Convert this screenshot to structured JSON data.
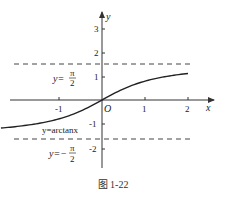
{
  "chart_data": {
    "type": "line",
    "title": "",
    "xlabel": "x",
    "ylabel": "y",
    "origin_label": "O",
    "xlim": [
      -2.4,
      2.3
    ],
    "ylim": [
      -2.5,
      3.6
    ],
    "x_ticks": [
      {
        "value": -1,
        "label": "-1"
      },
      {
        "value": 1,
        "label": "1"
      },
      {
        "value": 2,
        "label": "2"
      }
    ],
    "y_ticks": [
      {
        "value": 3,
        "label": "3"
      },
      {
        "value": 2,
        "label": "2"
      },
      {
        "value": 1,
        "label": "1"
      },
      {
        "value": -1,
        "label": "-1"
      },
      {
        "value": -2,
        "label": "-2"
      }
    ],
    "series": [
      {
        "name": "y=arctanx",
        "function": "arctan(x)",
        "x_range": [
          -2.35,
          2.0
        ],
        "x": [
          -2.35,
          -2,
          -1.5,
          -1,
          -0.5,
          0,
          0.5,
          1,
          1.5,
          2
        ],
        "values": [
          -1.17,
          -1.107,
          -0.983,
          -0.785,
          -0.464,
          0,
          0.464,
          0.785,
          0.983,
          1.107
        ]
      }
    ],
    "asymptotes": [
      {
        "y": 1.5708,
        "style": "dashed",
        "label_prefix": "y=",
        "label_num": "π",
        "label_den": "2"
      },
      {
        "y": -1.5708,
        "style": "dashed",
        "label_prefix": "y=−",
        "label_num": "π",
        "label_den": "2"
      }
    ],
    "annotations": [
      {
        "text": "y=arctanx",
        "near": [
          -0.8,
          -1.2
        ]
      }
    ],
    "grid": false,
    "legend": "none"
  },
  "labels": {
    "x_axis": "x",
    "y_axis": "y",
    "origin": "O",
    "tick_x_m1": "-1",
    "tick_x_1": "1",
    "tick_x_2": "2",
    "tick_y_3": "3",
    "tick_y_2": "2",
    "tick_y_1": "1",
    "tick_y_m1": "-1",
    "tick_y_m2": "-2",
    "curve_label": "y=arctanx",
    "asym_top_prefix": "y=",
    "asym_bot_prefix": "y=−",
    "pi": "π",
    "two": "2"
  },
  "caption": "图 1-22",
  "colors": {
    "axis": "#333333",
    "curve": "#222222",
    "dashed": "#444444",
    "background": "#ffffff"
  }
}
